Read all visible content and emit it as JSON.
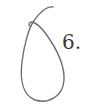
{
  "figure": {
    "label": "6.",
    "shape": "teardrop-loop-with-stem",
    "stroke_color": "#6e6e6e",
    "text_color": "#3a3a3a",
    "background": "#ffffff"
  }
}
